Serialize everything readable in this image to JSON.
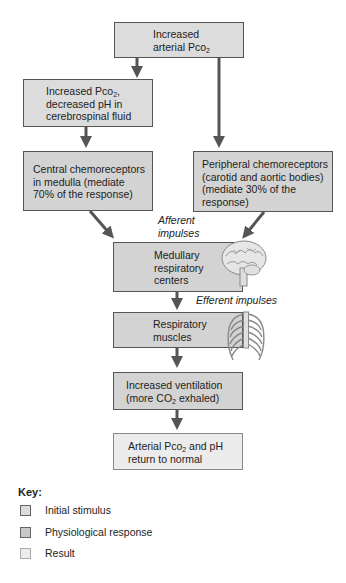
{
  "boxes": {
    "increased_arterial_pco2": {
      "line1": "Increased",
      "line2": "arterial Pco",
      "sub": "2",
      "type": "initial_stimulus"
    },
    "increased_pco2_csf": {
      "line1a": "Increased Pco",
      "sub": "2",
      "line1b": ",",
      "line2": "decreased pH in",
      "line3": "cerebrospinal fluid",
      "type": "initial_stimulus"
    },
    "central_chemoreceptors": {
      "line1": "Central chemoreceptors",
      "line2": "in medulla (mediate",
      "line3": "70% of the response)",
      "type": "physiological_response"
    },
    "peripheral_chemoreceptors": {
      "line1": "Peripheral chemoreceptors",
      "line2": "(carotid and aortic bodies)",
      "line3": "(mediate 30% of the",
      "line4": "response)",
      "type": "physiological_response"
    },
    "medullary_centers": {
      "line1": "Medullary",
      "line2": "respiratory",
      "line3": "centers",
      "type": "physiological_response"
    },
    "respiratory_muscles": {
      "line1": "Respiratory",
      "line2": "muscles",
      "type": "physiological_response"
    },
    "increased_ventilation": {
      "line1": "Increased ventilation",
      "line2a": "(more CO",
      "sub": "2",
      "line2b": " exhaled)",
      "type": "physiological_response"
    },
    "return_to_normal": {
      "line1a": "Arterial Pco",
      "sub": "2",
      "line1b": " and pH",
      "line2": "return to normal",
      "type": "result"
    }
  },
  "labels": {
    "afferent_line1": "Afferent",
    "afferent_line2": "impulses",
    "efferent": "Efferent impulses"
  },
  "illustrations": [
    "brain-icon",
    "ribcage-icon"
  ],
  "key": {
    "title": "Key:",
    "items": [
      {
        "label": "Initial stimulus",
        "color": "#dcdcdc"
      },
      {
        "label": "Physiological response",
        "color": "#c8c8c8"
      },
      {
        "label": "Result",
        "color": "#ececec"
      }
    ]
  },
  "colors": {
    "arrow": "#555555",
    "box_border": "#555555"
  }
}
